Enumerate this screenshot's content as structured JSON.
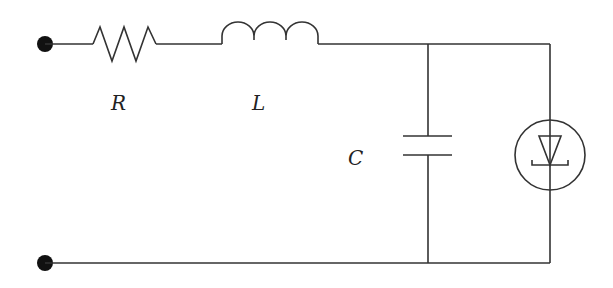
{
  "diagram": {
    "type": "circuit-schematic",
    "components": [
      {
        "id": "R",
        "kind": "resistor",
        "label": "R"
      },
      {
        "id": "L",
        "kind": "inductor",
        "label": "L"
      },
      {
        "id": "C",
        "kind": "capacitor",
        "label": "C"
      },
      {
        "id": "D",
        "kind": "diode-in-circle",
        "label": ""
      }
    ],
    "terminals": [
      {
        "id": "top-terminal"
      },
      {
        "id": "bottom-terminal"
      }
    ],
    "connections": [
      [
        "top-terminal",
        "R"
      ],
      [
        "R",
        "L"
      ],
      [
        "L",
        "C"
      ],
      [
        "L",
        "D"
      ],
      [
        "C",
        "bottom-terminal"
      ],
      [
        "D",
        "bottom-terminal"
      ]
    ],
    "colors": {
      "line": "#333333",
      "background": "#ffffff",
      "terminal": "#111111"
    }
  }
}
